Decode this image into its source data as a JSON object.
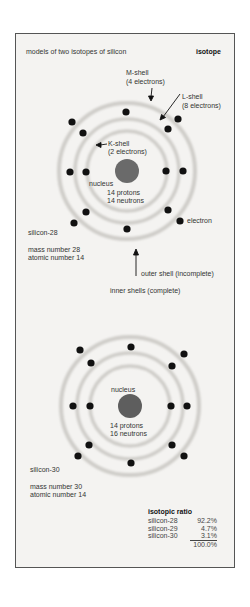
{
  "header": {
    "title": "models of two isotopes of silicon",
    "category": "isotope"
  },
  "atom1": {
    "shell_labels": {
      "m_shell": "M-shell",
      "m_count": "(4 electrons)",
      "l_shell": "L-shell",
      "l_count": "(8 electrons)",
      "k_shell": "K-shell",
      "k_count": "(2 electrons)"
    },
    "nucleus_label": "nucleus",
    "protons": "14 protons",
    "neutrons": "14 neutrons",
    "electron_label": "electron",
    "name": "silicon-28",
    "mass_number": "mass number 28",
    "atomic_number": "atomic number 14",
    "outer_shell_note": "outer shell (incomplete)",
    "inner_shells_note": "inner shells (complete)"
  },
  "atom2": {
    "nucleus_label": "nucleus",
    "protons": "14 protons",
    "neutrons": "16 neutrons",
    "name": "silicon-30",
    "mass_number": "mass number 30",
    "atomic_number": "atomic number 14"
  },
  "isotopic_ratio": {
    "title": "isotopic ratio",
    "rows": [
      {
        "name": "silicon-28",
        "value": "92.2%"
      },
      {
        "name": "silicon-29",
        "value": "4.7%"
      },
      {
        "name": "silicon-30",
        "value": "3.1%"
      }
    ],
    "total": "100.0%"
  },
  "colors": {
    "panel_bg": "#f4f3f1",
    "nucleus": "#666666",
    "electron": "#111111",
    "shell_ring": "#d6d4d0"
  }
}
